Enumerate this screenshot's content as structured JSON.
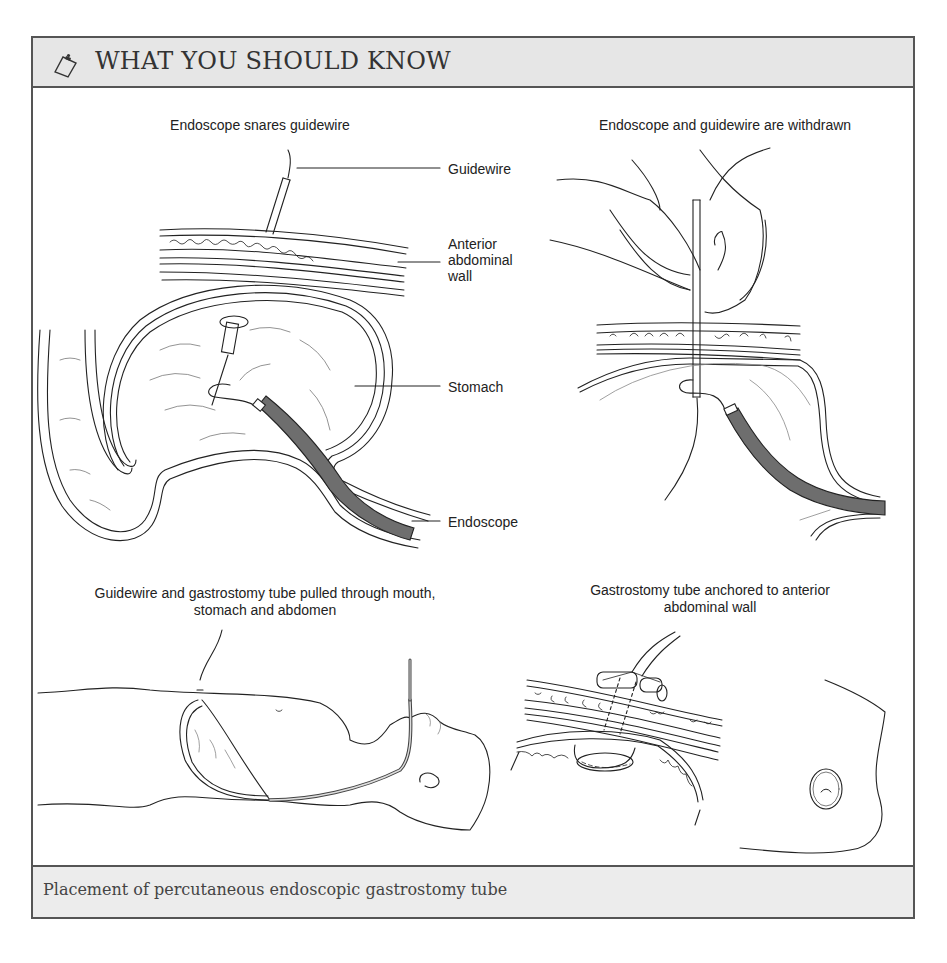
{
  "header": {
    "icon": "clipboard-icon",
    "title": "WHAT YOU SHOULD KNOW"
  },
  "panels": [
    {
      "title": "Endoscope snares guidewire",
      "labels": [
        "Guidewire",
        "Anterior abdominal wall",
        "Stomach",
        "Endoscope"
      ]
    },
    {
      "title": "Endoscope and guidewire are withdrawn",
      "labels": []
    },
    {
      "title_line1": "Guidewire and gastrostomy tube pulled through mouth,",
      "title_line2": "stomach and abdomen",
      "labels": []
    },
    {
      "title_line1": "Gastrostomy tube anchored to anterior",
      "title_line2": "abdominal wall",
      "labels": []
    }
  ],
  "labels": {
    "guidewire": "Guidewire",
    "anterior_1": "Anterior",
    "anterior_2": "abdominal",
    "anterior_3": "wall",
    "stomach": "Stomach",
    "endoscope": "Endoscope"
  },
  "caption": "Placement of percutaneous endoscopic gastrostomy tube",
  "colors": {
    "frame_border": "#555555",
    "header_bg": "#e6e6e6",
    "caption_bg": "#ececec",
    "endoscope_fill": "#6e6e6e"
  }
}
